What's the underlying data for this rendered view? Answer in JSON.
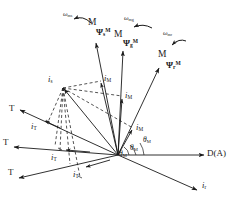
{
  "figure": {
    "background": "#ffffff",
    "stroke": "#1a1a1a",
    "origin": {
      "x": 118,
      "y": 155
    }
  },
  "axis": {
    "label": "D(A)",
    "name": "direct-axis",
    "from": {
      "x": 118,
      "y": 155
    },
    "to": {
      "x": 206,
      "y": 155
    }
  },
  "omega_labels": [
    {
      "id": "omega-ms",
      "base": "ω",
      "sub": "ms",
      "x": 63,
      "y": 14
    },
    {
      "id": "omega-mg",
      "base": "ω",
      "sub": "mg",
      "x": 124,
      "y": 18
    },
    {
      "id": "omega-mr",
      "base": "ω",
      "sub": "mr",
      "x": 163,
      "y": 33
    }
  ],
  "m_labels": [
    {
      "id": "m-label-stator",
      "text": "M",
      "x": 88,
      "y": 21
    },
    {
      "id": "m-label-airgap",
      "text": "M",
      "x": 114,
      "y": 33
    },
    {
      "id": "m-label-rotor",
      "text": "M",
      "x": 158,
      "y": 53
    }
  ],
  "flux_vectors": [
    {
      "id": "psi-s",
      "base": "Ψ",
      "sub": "s",
      "sup": "M",
      "label_x": 97,
      "label_y": 31,
      "from": {
        "x": 118,
        "y": 155
      },
      "to": {
        "x": 95,
        "y": 41
      },
      "omega_arc": {
        "cx": 80,
        "cy": 16,
        "r": 13,
        "a0": 200,
        "a1": 330
      }
    },
    {
      "id": "psi-g",
      "base": "Ψ",
      "sub": "g",
      "sup": "M",
      "label_x": 124,
      "label_y": 42,
      "from": {
        "x": 118,
        "y": 155
      },
      "to": {
        "x": 123,
        "y": 49
      },
      "omega_arc": {
        "cx": 140,
        "cy": 22,
        "r": 13,
        "a0": 200,
        "a1": 335
      }
    },
    {
      "id": "psi-r",
      "base": "Ψ",
      "sub": "r",
      "sup": "M",
      "label_x": 166,
      "label_y": 64,
      "from": {
        "x": 118,
        "y": 155
      },
      "to": {
        "x": 160,
        "y": 66
      },
      "omega_arc": {
        "cx": 178,
        "cy": 38,
        "r": 12,
        "a0": 205,
        "a1": 335
      }
    }
  ],
  "is_vector": {
    "id": "i-s",
    "base": "i",
    "sub": "s",
    "label_x": 49,
    "label_y": 79,
    "tip": {
      "x": 62,
      "y": 88
    },
    "from": {
      "x": 118,
      "y": 155
    }
  },
  "ir_vector": {
    "id": "i-r",
    "base": "i",
    "sub": "r",
    "label_x": 203,
    "label_y": 185,
    "from": {
      "x": 118,
      "y": 155
    },
    "to": {
      "x": 199,
      "y": 191
    }
  },
  "im_components": [
    {
      "id": "i-m-stator",
      "base": "i",
      "sub": "M",
      "label_x": 104,
      "label_y": 78,
      "from": {
        "x": 118,
        "y": 155
      },
      "to": {
        "x": 100,
        "y": 82
      }
    },
    {
      "id": "i-m-airgap",
      "base": "i",
      "sub": "M",
      "label_x": 124,
      "label_y": 95,
      "from": {
        "x": 118,
        "y": 155
      },
      "to": {
        "x": 122,
        "y": 97
      }
    },
    {
      "id": "i-m-rotor",
      "base": "i",
      "sub": "M",
      "label_x": 135,
      "label_y": 127,
      "from": {
        "x": 118,
        "y": 155
      },
      "to": {
        "x": 131,
        "y": 128
      }
    }
  ],
  "it_components": [
    {
      "id": "i-t-stator",
      "base": "i",
      "sub": "T",
      "label_x": 30,
      "label_y": 126,
      "from": {
        "x": 118,
        "y": 155
      },
      "to": {
        "x": 25,
        "y": 113
      }
    },
    {
      "id": "i-t-airgap",
      "base": "i",
      "sub": "T",
      "label_x": 50,
      "label_y": 157,
      "from": {
        "x": 118,
        "y": 155
      },
      "to": {
        "x": 18,
        "y": 148
      }
    },
    {
      "id": "i-t-rotor",
      "base": "i",
      "sub": "T",
      "label_x": 72,
      "label_y": 174,
      "from": {
        "x": 118,
        "y": 155
      },
      "to": {
        "x": 22,
        "y": 177
      }
    }
  ],
  "t_labels": [
    {
      "id": "t-label-stator",
      "text": "T",
      "x": 11,
      "y": 108
    },
    {
      "id": "t-label-airgap",
      "text": "T",
      "x": 5,
      "y": 142
    },
    {
      "id": "t-label-rotor",
      "text": "T",
      "x": 10,
      "y": 172
    }
  ],
  "angle_labels": [
    {
      "id": "theta-m-rotor",
      "base": "θ",
      "sub": "M",
      "x": 141,
      "y": 140
    },
    {
      "id": "theta-m-airgap",
      "base": "θ",
      "sub": "M",
      "x": 129,
      "y": 147
    },
    {
      "id": "theta-m-stator",
      "base": "θ",
      "sub": "M",
      "x": 118,
      "y": 152
    }
  ],
  "construction": {
    "note": "dashed parallelogram construction lines from i_s tip to component vectors",
    "dashed_lines": [
      {
        "from": {
          "x": 62,
          "y": 88
        },
        "to": {
          "x": 100,
          "y": 82
        }
      },
      {
        "from": {
          "x": 62,
          "y": 88
        },
        "to": {
          "x": 122,
          "y": 97
        }
      },
      {
        "from": {
          "x": 62,
          "y": 88
        },
        "to": {
          "x": 131,
          "y": 128
        }
      },
      {
        "from": {
          "x": 62,
          "y": 88
        },
        "to": {
          "x": 25,
          "y": 113
        }
      },
      {
        "from": {
          "x": 62,
          "y": 88
        },
        "to": {
          "x": 57,
          "y": 148
        }
      },
      {
        "from": {
          "x": 62,
          "y": 88
        },
        "to": {
          "x": 79,
          "y": 177
        }
      }
    ]
  }
}
